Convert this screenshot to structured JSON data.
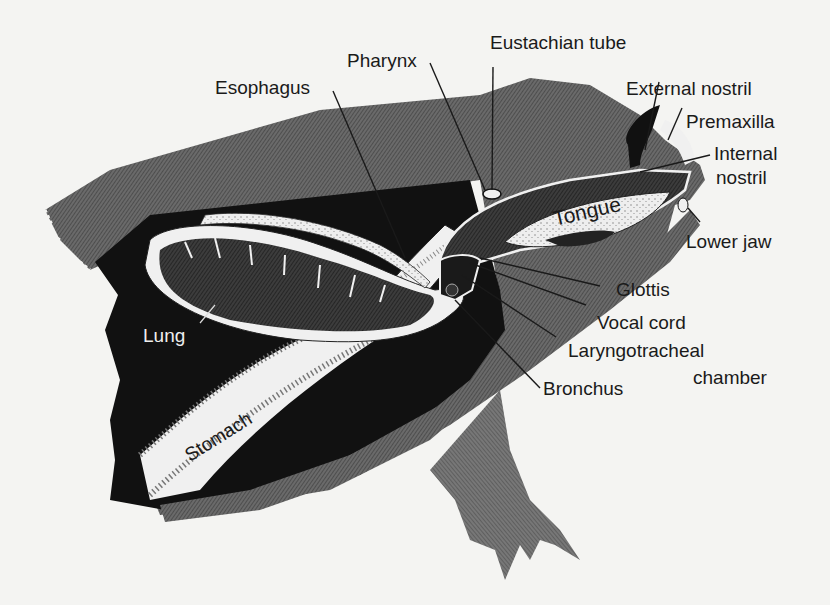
{
  "figure": {
    "colors": {
      "background": "#f4f4f2",
      "body_hatch": "#5a5a5a",
      "body_cavity": "#111111",
      "organ_light": "#f2f2f2",
      "label_text": "#1a1a1a"
    }
  },
  "labels": {
    "esophagus": "Esophagus",
    "pharynx": "Pharynx",
    "eustachian_tube": "Eustachian tube",
    "external_nostril": "External nostril",
    "premaxilla": "Premaxilla",
    "internal_nostril_1": "Internal",
    "internal_nostril_2": "nostril",
    "tongue": "Tongue",
    "lower_jaw": "Lower jaw",
    "glottis": "Glottis",
    "vocal_cord": "Vocal cord",
    "laryngotracheal_1": "Laryngotracheal",
    "laryngotracheal_2": "chamber",
    "bronchus": "Bronchus",
    "lung": "Lung",
    "stomach": "Stomach"
  }
}
